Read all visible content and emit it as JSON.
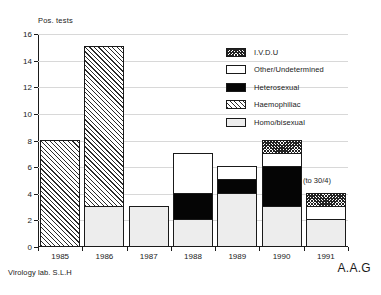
{
  "chart_data": {
    "type": "bar",
    "title": "",
    "subtitle": "",
    "xlabel": "",
    "ylabel": "Pos. tests",
    "ylim": [
      0,
      16
    ],
    "ytick_labels": [
      "0",
      "2",
      "4",
      "6",
      "8",
      "10",
      "12",
      "14",
      "16"
    ],
    "ytick_values": [
      0,
      2,
      4,
      6,
      8,
      10,
      12,
      14,
      16
    ],
    "grid": true,
    "grid_axis": "y",
    "stacked": true,
    "legend_position": "upper-right-inside",
    "categories": [
      "1985",
      "1986",
      "1987",
      "1988",
      "1989",
      "1990",
      "1991"
    ],
    "series": [
      {
        "name": "Homo/bisexual",
        "key": "homo",
        "values": [
          0,
          3,
          3,
          2,
          4,
          3,
          2
        ]
      },
      {
        "name": "Haemophiliac",
        "key": "haemo",
        "values": [
          8,
          12,
          0,
          0,
          0,
          0,
          0
        ]
      },
      {
        "name": "Heterosexual",
        "key": "hetero",
        "values": [
          0,
          0,
          0,
          2,
          1,
          3,
          0
        ]
      },
      {
        "name": "Other/Undetermined",
        "key": "other",
        "values": [
          0,
          0,
          0,
          3,
          1,
          1,
          1
        ]
      },
      {
        "name": "I.V.D.U",
        "key": "ivdu",
        "values": [
          0,
          0,
          0,
          0,
          0,
          1,
          1
        ]
      }
    ],
    "totals": [
      8,
      15,
      3,
      7,
      6,
      8,
      4
    ],
    "annotations": [
      {
        "text": "(to 30/4)",
        "attached_to": "1991"
      }
    ]
  },
  "legend": {
    "items": [
      {
        "label": "I.V.D.U",
        "swatch": "ivdu-pattern-checker"
      },
      {
        "label": "Other/Undetermined",
        "swatch": "white-fill"
      },
      {
        "label": "Heterosexual",
        "swatch": "black-fill"
      },
      {
        "label": "Haemophiliac",
        "swatch": "haemo-pattern-diagonal"
      },
      {
        "label": "Homo/bisexual",
        "swatch": "light-grey-fill"
      }
    ]
  },
  "footer": {
    "source_label": "Virology lab. S.L.H",
    "author_initials": "A.A.G"
  },
  "colors": {
    "axis": "#1a1a1a",
    "gridline": "#d8d8d8",
    "homo_bisexual": "#ededed",
    "other_undetermined": "#ffffff",
    "heterosexual": "#050505",
    "haemophiliac": "#ffffff",
    "ivdu": "#ffffff",
    "background": "#ffffff"
  }
}
